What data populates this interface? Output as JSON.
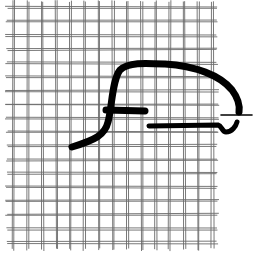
{
  "image": {
    "subject": "hand-drawn sketch of black marker strokes over a woven wire mesh grid",
    "background_color": "#ffffff",
    "mesh": {
      "description": "woven wire mesh",
      "line_color": "#6a6a6a",
      "columns": 15,
      "rows": 18
    },
    "strokes": [
      {
        "name": "main-curve",
        "description": "curve rising from lower-left, arching over to the right and descending",
        "color": "#000000"
      },
      {
        "name": "cross-bar",
        "description": "short horizontal bar crossing the rising curve",
        "color": "#000000"
      },
      {
        "name": "lower-bar",
        "description": "horizontal bar ending in a small hook at the right",
        "color": "#000000"
      },
      {
        "name": "right-tick",
        "description": "thin horizontal line extending right beyond the mesh",
        "color": "#000000"
      }
    ]
  }
}
